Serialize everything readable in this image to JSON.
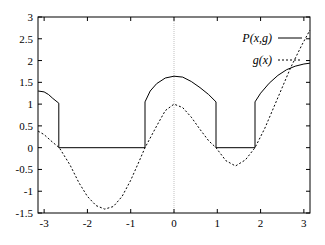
{
  "chart_data": {
    "type": "line",
    "title": "",
    "xlabel": "",
    "ylabel": "",
    "xlim": [
      -3.14159,
      3.14159
    ],
    "ylim": [
      -1.5,
      3
    ],
    "grid": false,
    "legend_position": "top-right",
    "x_ticks": [
      -3,
      -2,
      -1,
      0,
      1,
      2,
      3
    ],
    "x_tick_labels": [
      "-3",
      "-2",
      "-1",
      "0",
      "1",
      "2",
      "3"
    ],
    "y_ticks": [
      -1.5,
      -1,
      -0.5,
      0,
      0.5,
      1,
      1.5,
      2,
      2.5,
      3
    ],
    "y_tick_labels": [
      "-1.5",
      "-1",
      "-0.5",
      "0",
      "0.5",
      "1",
      "1.5",
      "2",
      "2.5",
      "3"
    ],
    "vertical_reference_line_x": 0,
    "series": [
      {
        "name": "P(x,g)",
        "style": "solid",
        "points": [
          [
            -3.14,
            1.3
          ],
          [
            -3.0,
            1.28
          ],
          [
            -2.9,
            1.22
          ],
          [
            -2.8,
            1.13
          ],
          [
            -2.66,
            1.02
          ],
          [
            -2.66,
            0
          ],
          [
            -0.67,
            0
          ],
          [
            -0.67,
            1.05
          ],
          [
            -0.55,
            1.3
          ],
          [
            -0.4,
            1.47
          ],
          [
            -0.2,
            1.6
          ],
          [
            0.0,
            1.64
          ],
          [
            0.2,
            1.62
          ],
          [
            0.4,
            1.52
          ],
          [
            0.6,
            1.38
          ],
          [
            0.8,
            1.22
          ],
          [
            0.97,
            1.05
          ],
          [
            0.97,
            0
          ],
          [
            1.87,
            0
          ],
          [
            1.87,
            1.05
          ],
          [
            2.0,
            1.25
          ],
          [
            2.2,
            1.48
          ],
          [
            2.4,
            1.66
          ],
          [
            2.6,
            1.79
          ],
          [
            2.8,
            1.87
          ],
          [
            3.0,
            1.92
          ],
          [
            3.14,
            1.94
          ]
        ]
      },
      {
        "name": "g(x)",
        "style": "dashed",
        "points": [
          [
            -3.14,
            0.38
          ],
          [
            -3.0,
            0.3
          ],
          [
            -2.8,
            0.12
          ],
          [
            -2.65,
            0.0
          ],
          [
            -2.4,
            -0.4
          ],
          [
            -2.2,
            -0.8
          ],
          [
            -2.0,
            -1.12
          ],
          [
            -1.8,
            -1.33
          ],
          [
            -1.6,
            -1.41
          ],
          [
            -1.4,
            -1.35
          ],
          [
            -1.2,
            -1.12
          ],
          [
            -1.0,
            -0.75
          ],
          [
            -0.8,
            -0.3
          ],
          [
            -0.67,
            0.0
          ],
          [
            -0.4,
            0.5
          ],
          [
            -0.2,
            0.85
          ],
          [
            0.0,
            1.0
          ],
          [
            0.2,
            0.92
          ],
          [
            0.4,
            0.7
          ],
          [
            0.6,
            0.42
          ],
          [
            0.8,
            0.16
          ],
          [
            0.97,
            0.0
          ],
          [
            1.2,
            -0.3
          ],
          [
            1.42,
            -0.42
          ],
          [
            1.65,
            -0.28
          ],
          [
            1.87,
            0.0
          ],
          [
            2.1,
            0.45
          ],
          [
            2.4,
            1.15
          ],
          [
            2.7,
            1.85
          ],
          [
            2.95,
            2.35
          ],
          [
            3.14,
            2.7
          ]
        ]
      }
    ]
  },
  "legend": {
    "items": [
      {
        "label": "P(x,g)",
        "style": "solid"
      },
      {
        "label": "g(x)",
        "style": "dashed"
      }
    ]
  },
  "colors": {
    "axis": "#000000",
    "line": "#000000",
    "reference_line": "#999999"
  }
}
